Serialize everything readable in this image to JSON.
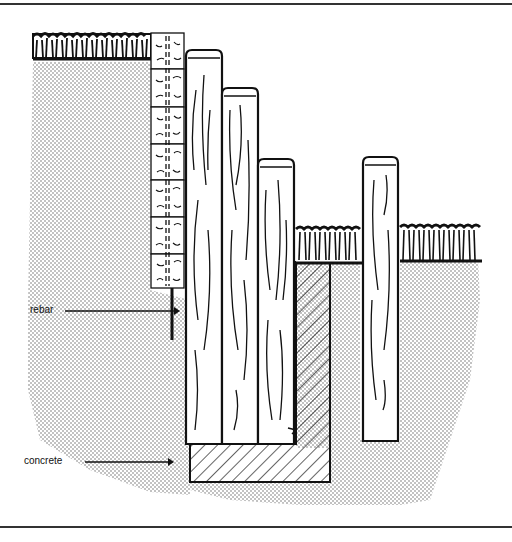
{
  "diagram": {
    "labels": [
      {
        "id": "rebar",
        "text": "rebar"
      },
      {
        "id": "concrete",
        "text": "concrete"
      }
    ],
    "components": [
      "upper-grade-grass",
      "lower-grade-grass",
      "stacked-block-wall",
      "rebar-pin",
      "timber-post-tall",
      "timber-post-medium",
      "timber-post-short",
      "timber-post-freestanding",
      "concrete-footing",
      "soil-backfill"
    ],
    "colors": {
      "ink": "#111111",
      "soil": "#555555",
      "background": "#ffffff"
    }
  }
}
